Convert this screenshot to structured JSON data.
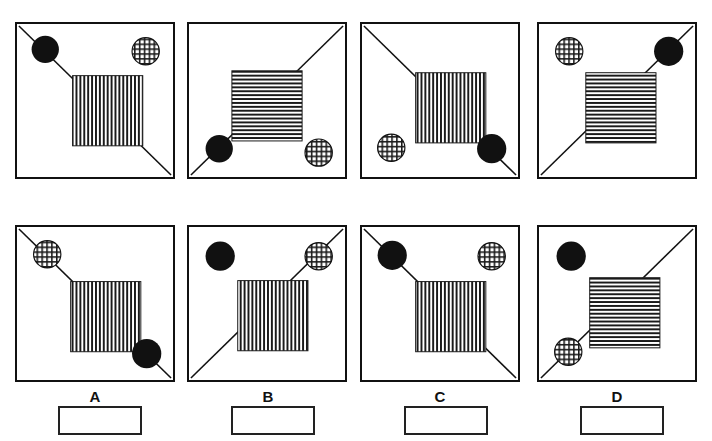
{
  "page": {
    "title_cropped": "",
    "background_color": "#ffffff",
    "ink_color": "#111111"
  },
  "figure": {
    "type": "visual-analogy-multiple-choice",
    "rows": 2,
    "columns": 4,
    "panel_count": 8,
    "stimulus_row_label": "top",
    "answer_row_label": "bottom"
  },
  "legend": {
    "black_circle": "solid-black-circle",
    "checkered_circle": "checkered-circle",
    "vertical_square": "vertical-striped-square",
    "horizontal_square": "horizontal-striped-square",
    "diagonal_line": "diagonal-line"
  },
  "panels": [
    {
      "id": "panel-top-1",
      "row": "top",
      "index": 1,
      "label": "",
      "diagonal": "tl-br",
      "square_fill": "vertical",
      "black_circle": {
        "position": "upper-left",
        "on_line": true
      },
      "checkered_circle": {
        "position": "upper-right",
        "on_line": false
      }
    },
    {
      "id": "panel-top-2",
      "row": "top",
      "index": 2,
      "label": "",
      "diagonal": "bl-tr",
      "square_fill": "horizontal",
      "black_circle": {
        "position": "lower-left",
        "on_line": true
      },
      "checkered_circle": {
        "position": "lower-right",
        "on_line": false
      }
    },
    {
      "id": "panel-top-3",
      "row": "top",
      "index": 3,
      "label": "",
      "diagonal": "tl-br",
      "square_fill": "vertical",
      "black_circle": {
        "position": "lower-right",
        "on_line": true
      },
      "checkered_circle": {
        "position": "lower-left",
        "on_line": false
      }
    },
    {
      "id": "panel-top-4",
      "row": "top",
      "index": 4,
      "label": "",
      "diagonal": "bl-tr",
      "square_fill": "horizontal",
      "black_circle": {
        "position": "upper-right",
        "on_line": true
      },
      "checkered_circle": {
        "position": "upper-left",
        "on_line": false
      }
    },
    {
      "id": "panel-option-a",
      "row": "bottom",
      "index": 1,
      "label": "A",
      "diagonal": "tl-br",
      "square_fill": "vertical",
      "black_circle": {
        "position": "lower-right",
        "on_line": true
      },
      "checkered_circle": {
        "position": "upper-left",
        "on_line": true
      }
    },
    {
      "id": "panel-option-b",
      "row": "bottom",
      "index": 2,
      "label": "B",
      "diagonal": "bl-tr",
      "square_fill": "vertical",
      "black_circle": {
        "position": "upper-left",
        "on_line": false
      },
      "checkered_circle": {
        "position": "upper-right",
        "on_line": true
      }
    },
    {
      "id": "panel-option-c",
      "row": "bottom",
      "index": 3,
      "label": "C",
      "diagonal": "tl-br",
      "square_fill": "vertical",
      "black_circle": {
        "position": "upper-left",
        "on_line": true
      },
      "checkered_circle": {
        "position": "upper-right",
        "on_line": false
      }
    },
    {
      "id": "panel-option-d",
      "row": "bottom",
      "index": 4,
      "label": "D",
      "diagonal": "bl-tr",
      "square_fill": "horizontal",
      "black_circle": {
        "position": "upper-left",
        "on_line": false
      },
      "checkered_circle": {
        "position": "lower-left",
        "on_line": true
      }
    }
  ],
  "options": [
    {
      "label": "A",
      "answer_value": ""
    },
    {
      "label": "B",
      "answer_value": ""
    },
    {
      "label": "C",
      "answer_value": ""
    },
    {
      "label": "D",
      "answer_value": ""
    }
  ]
}
